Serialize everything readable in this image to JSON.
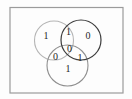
{
  "diagram": {
    "type": "venn-diagram-three-sets",
    "background_color": "#fdfdfd",
    "frame": {
      "border_color": "#9b9b9b"
    },
    "text_color": "#1f1f1f",
    "circles": [
      {
        "name": "top-left-circle",
        "color": "#b5b5b5"
      },
      {
        "name": "top-right-circle",
        "color": "#3c3c3c"
      },
      {
        "name": "bottom-circle",
        "color": "#8f8f8f"
      }
    ],
    "regions": [
      {
        "region": "top-left-only",
        "value": "1"
      },
      {
        "region": "top-left-and-top-right",
        "value": "1"
      },
      {
        "region": "top-right-only",
        "value": "0"
      },
      {
        "region": "center-all-three",
        "value": "0"
      },
      {
        "region": "top-left-and-bottom",
        "value": "0"
      },
      {
        "region": "top-right-and-bottom",
        "value": "1"
      },
      {
        "region": "bottom-only",
        "value": "1"
      }
    ]
  }
}
